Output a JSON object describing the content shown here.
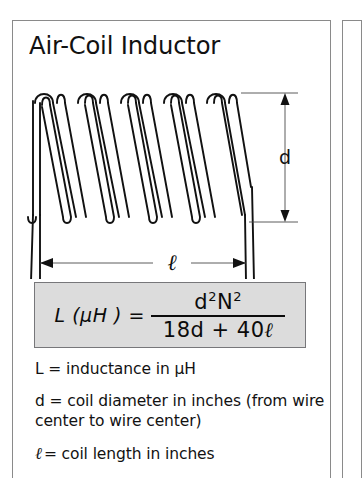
{
  "panel": {
    "title": "Air-Coil Inductor",
    "accent_color": "#dcdcdc",
    "border_color": "#8a8a8a"
  },
  "diagram": {
    "name": "air-coil-inductor-diagram",
    "coil_turns": 7,
    "dimension_labels": {
      "diameter": "d",
      "length": "ℓ"
    }
  },
  "formula": {
    "lhs": "L (μH ) =",
    "numerator_base_1": "d",
    "numerator_exp_1": "2",
    "numerator_base_2": "N",
    "numerator_exp_2": "2",
    "denominator_a": "18d + 40",
    "denominator_ell": "ℓ",
    "plain": "L (μH) = d²N² / (18d + 40ℓ)"
  },
  "legend": [
    {
      "symbol": "L",
      "text": "L = inductance in μH"
    },
    {
      "symbol": "d",
      "text": "d = coil diameter in inches (from wire center to wire center)"
    },
    {
      "symbol": "ℓ",
      "text": "= coil length in inches"
    }
  ]
}
